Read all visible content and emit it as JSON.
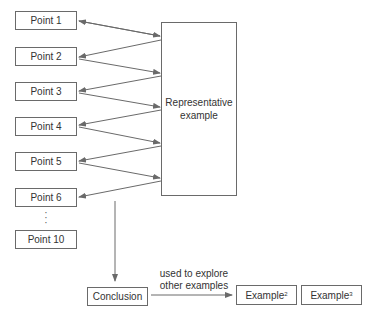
{
  "diagram": {
    "points": [
      {
        "label": "Point 1"
      },
      {
        "label": "Point 2"
      },
      {
        "label": "Point 3"
      },
      {
        "label": "Point 4"
      },
      {
        "label": "Point 5"
      },
      {
        "label": "Point 6"
      }
    ],
    "ellipsis": "⋮",
    "last_point": {
      "label": "Point 10"
    },
    "representative": {
      "line1": "Representative",
      "line2": "example"
    },
    "conclusion": {
      "label": "Conclusion"
    },
    "arrow_label": {
      "line1": "used to explore",
      "line2": "other examples"
    },
    "examples": [
      {
        "label": "Example",
        "sup": "2"
      },
      {
        "label": "Example",
        "sup": "3"
      }
    ],
    "colors": {
      "line": "#6a6a6a",
      "text": "#333333"
    }
  }
}
